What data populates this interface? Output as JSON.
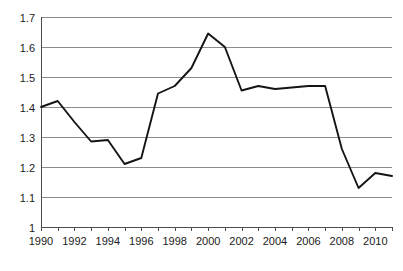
{
  "chart_data": {
    "type": "line",
    "title": "",
    "subtitle": "",
    "xlabel": "",
    "ylabel": "",
    "xlim": [
      1990,
      2011
    ],
    "ylim": [
      1.0,
      1.7
    ],
    "grid": true,
    "grid_axis": "y",
    "legend": false,
    "legend_position": "none",
    "line_color": "#141414",
    "grid_color": "#8c8c8c",
    "axis_color": "#4d4d4d",
    "background_color": "#ffffff",
    "x": [
      1990,
      1991,
      1992,
      1993,
      1994,
      1995,
      1996,
      1997,
      1998,
      1999,
      2000,
      2001,
      2002,
      2003,
      2004,
      2005,
      2006,
      2007,
      2008,
      2009,
      2010,
      2011
    ],
    "values": [
      1.4,
      1.42,
      1.35,
      1.285,
      1.29,
      1.21,
      1.23,
      1.445,
      1.47,
      1.53,
      1.645,
      1.6,
      1.455,
      1.47,
      1.46,
      1.465,
      1.47,
      1.47,
      1.26,
      1.13,
      1.18,
      1.17
    ],
    "series": [
      {
        "name": "series-1",
        "values": [
          1.4,
          1.42,
          1.35,
          1.285,
          1.29,
          1.21,
          1.23,
          1.445,
          1.47,
          1.53,
          1.645,
          1.6,
          1.455,
          1.47,
          1.46,
          1.465,
          1.47,
          1.47,
          1.26,
          1.13,
          1.18,
          1.17
        ]
      }
    ],
    "ytick_values": [
      1.7,
      1.6,
      1.5,
      1.4,
      1.3,
      1.2,
      1.1,
      1.0
    ],
    "ytick_labels": [
      "1.7",
      "1.6",
      "1.5",
      "1.4",
      "1.3",
      "1.2",
      "1.1",
      "1"
    ],
    "xtick_values": [
      1990,
      1991,
      1992,
      1993,
      1994,
      1995,
      1996,
      1997,
      1998,
      1999,
      2000,
      2001,
      2002,
      2003,
      2004,
      2005,
      2006,
      2007,
      2008,
      2009,
      2010,
      2011
    ],
    "xtick_labels_shown": [
      "1990",
      "1992",
      "1994",
      "1996",
      "1998",
      "2000",
      "2002",
      "2004",
      "2006",
      "2008",
      "2010"
    ],
    "xtick_labeled_values": [
      1990,
      1992,
      1994,
      1996,
      1998,
      2000,
      2002,
      2004,
      2006,
      2008,
      2010
    ]
  },
  "plot_area": {
    "left": 41,
    "right": 392,
    "top": 17,
    "bottom": 227
  }
}
